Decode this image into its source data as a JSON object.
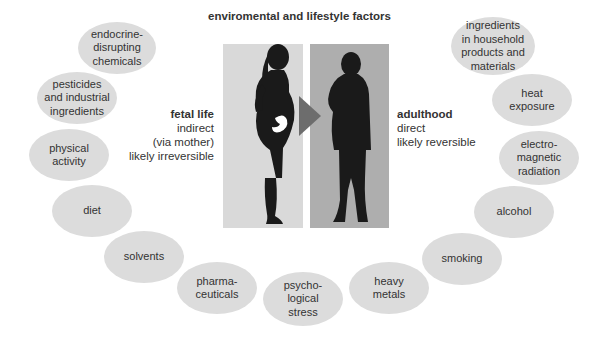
{
  "title": "enviromental and lifestyle factors",
  "stages": {
    "fetal": {
      "head": "fetal life",
      "lines": [
        "indirect",
        "(via mother)",
        "likely irreversible"
      ]
    },
    "adult": {
      "head": "adulthood",
      "lines": [
        "direct",
        "likely reversible"
      ]
    }
  },
  "figures": {
    "left": "pregnant-woman-silhouette",
    "right": "man-silhouette",
    "arrow": "right-arrow"
  },
  "colors": {
    "bubble": "#dcdcdc",
    "panel_left": "#d9d9d9",
    "panel_right": "#aeaeae",
    "arrow": "#6d6d6d",
    "silhouette": "#1a1a1a"
  },
  "factors": [
    {
      "label": "endocrine-\ndisrupting\nchemicals"
    },
    {
      "label": "pesticides\nand industrial\ningredients"
    },
    {
      "label": "physical\nactivity"
    },
    {
      "label": "diet"
    },
    {
      "label": "solvents"
    },
    {
      "label": "pharma-\nceuticals"
    },
    {
      "label": "psycho-\nlogical\nstress"
    },
    {
      "label": "heavy\nmetals"
    },
    {
      "label": "smoking"
    },
    {
      "label": "alcohol"
    },
    {
      "label": "electro-\nmagnetic\nradiation"
    },
    {
      "label": "heat\nexposure"
    },
    {
      "label": "ingredients\nin household\nproducts and\nmaterials"
    }
  ]
}
